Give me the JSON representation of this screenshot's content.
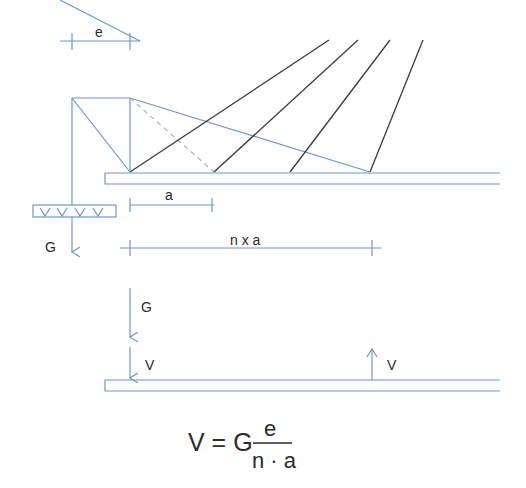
{
  "diagram": {
    "labels": {
      "eccentricity": "e",
      "spacing": "a",
      "total_span": "n x a",
      "load_top": "G",
      "load_bottom": "G",
      "reaction_left": "V",
      "reaction_right": "V"
    },
    "formula": {
      "lhs": "V = G",
      "numerator": "e",
      "denominator": "n · a"
    },
    "colors": {
      "structure": "#6f95cf",
      "cables": "#3a3a3a",
      "dashed": "#a8b4c8"
    }
  }
}
